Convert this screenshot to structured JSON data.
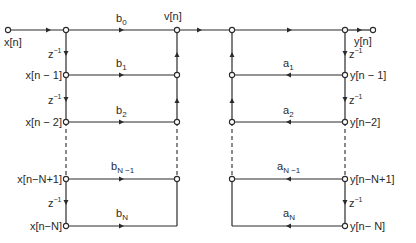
{
  "diagram": {
    "type": "signal-flow-graph",
    "colors": {
      "line": "#2a2a2a",
      "background": "#ffffff"
    },
    "input_label": "x[n]",
    "output_label": "y[n]",
    "intermediate_label": "v[n]",
    "delay_label": "z",
    "delay_exp": "−1",
    "feedforward": {
      "delay_nodes": [
        "x[n − 1]",
        "x[n − 2]",
        "x[n−N+1]",
        "x[n−N]"
      ],
      "coefficients": [
        {
          "base": "b",
          "sub": "0"
        },
        {
          "base": "b",
          "sub": "1"
        },
        {
          "base": "b",
          "sub": "2"
        },
        {
          "base": "b",
          "sub": "N −1"
        },
        {
          "base": "b",
          "sub": "N"
        }
      ]
    },
    "feedback": {
      "delay_nodes": [
        "y[n − 1]",
        "y[n−2]",
        "y[n−N+1]",
        "y[n− N]"
      ],
      "coefficients": [
        {
          "base": "a",
          "sub": "1"
        },
        {
          "base": "a",
          "sub": "2"
        },
        {
          "base": "a",
          "sub": "N −1"
        },
        {
          "base": "a",
          "sub": "N"
        }
      ]
    }
  }
}
